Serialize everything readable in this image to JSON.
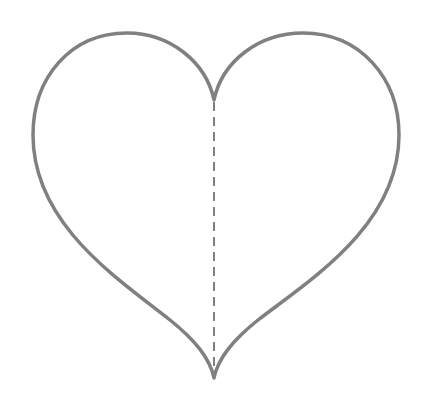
{
  "figure": {
    "shape": "heart-outline",
    "stroke_color": "#808080",
    "stroke_width": 3.5,
    "fill": "#ffffff",
    "background": "#ffffff",
    "symmetry_line": {
      "style": "dashed",
      "color": "#808080",
      "stroke_width": 2,
      "dash": "9 6"
    }
  }
}
